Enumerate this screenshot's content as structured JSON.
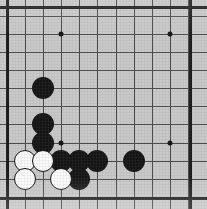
{
  "board": {
    "game": "Go",
    "view_label": "bottom-left corner of goban",
    "width_px": 207,
    "height_px": 209,
    "grid": {
      "spacing_px": 18.2,
      "origin_x_px": 7,
      "origin_y_px": 7,
      "columns_visible": 11,
      "rows_visible": 11,
      "x_lines_px": [
        7,
        25,
        43,
        61,
        79,
        97,
        116,
        134,
        152,
        170,
        188
      ],
      "y_lines_px": [
        7,
        16,
        34,
        52,
        70,
        88,
        106,
        124,
        143,
        161,
        179,
        197
      ]
    },
    "colors": {
      "board_surface": "#c9c9c9",
      "grid_line": "#4a4a4a",
      "border_line": "#1a1a1a",
      "black_stone": "#141414",
      "white_stone": "#fbfbfb",
      "white_stone_outline": "#101010",
      "hoshi": "#111111",
      "page_background": "#ffffff"
    },
    "borders": [
      {
        "name": "left-border",
        "orient": "v",
        "pos_px": 6
      },
      {
        "name": "right-border",
        "orient": "v",
        "pos_px": 189
      },
      {
        "name": "top-border",
        "orient": "h",
        "pos_px": 6
      },
      {
        "name": "bottom-border",
        "orient": "h",
        "pos_px": 197
      }
    ],
    "hoshi_points": [
      {
        "name": "hoshi-upper-left",
        "x": 61,
        "y": 34
      },
      {
        "name": "hoshi-upper-right",
        "x": 170,
        "y": 34
      },
      {
        "name": "hoshi-lower-left",
        "x": 61,
        "y": 143
      },
      {
        "name": "hoshi-lower-right",
        "x": 170,
        "y": 143
      }
    ],
    "stone_diameter_px": 22,
    "stones": [
      {
        "color": "black",
        "x": 43,
        "y": 88,
        "label": "black-stone-1"
      },
      {
        "color": "black",
        "x": 43,
        "y": 124,
        "label": "black-stone-2"
      },
      {
        "color": "black",
        "x": 43,
        "y": 143,
        "label": "black-stone-3"
      },
      {
        "color": "black",
        "x": 61,
        "y": 161,
        "label": "black-stone-4"
      },
      {
        "color": "black",
        "x": 79,
        "y": 161,
        "label": "black-stone-5"
      },
      {
        "color": "black",
        "x": 97,
        "y": 161,
        "label": "black-stone-6"
      },
      {
        "color": "black",
        "x": 134,
        "y": 161,
        "label": "black-stone-7"
      },
      {
        "color": "black",
        "x": 79,
        "y": 179,
        "label": "black-stone-8"
      },
      {
        "color": "white",
        "x": 25,
        "y": 161,
        "label": "white-stone-1"
      },
      {
        "color": "white",
        "x": 43,
        "y": 161,
        "label": "white-stone-2"
      },
      {
        "color": "white",
        "x": 25,
        "y": 179,
        "label": "white-stone-3"
      },
      {
        "color": "white",
        "x": 61,
        "y": 179,
        "label": "white-stone-4"
      }
    ],
    "counts": {
      "black_stones": 8,
      "white_stones": 4,
      "total_stones": 12
    }
  }
}
